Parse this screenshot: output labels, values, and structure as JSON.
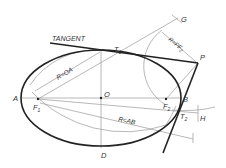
{
  "diagram": {
    "labels": {
      "tangent": "TANGENT",
      "t1": "T",
      "t1_sub": "1",
      "g": "G",
      "r_pf2": "R=PF",
      "r_pf2_sub": "2",
      "p": "P",
      "r_oa": "R=OA",
      "o": "O",
      "a": "A",
      "f1": "F",
      "f1_sub": "1",
      "b": "B",
      "f2": "F",
      "f2_sub": "2",
      "t2": "T",
      "t2_sub": "2",
      "h": "H",
      "r_ab": "R=AB",
      "d": "D"
    },
    "colors": {
      "bold_line": "#222222",
      "thin_line": "#888888",
      "text": "#333333"
    }
  }
}
